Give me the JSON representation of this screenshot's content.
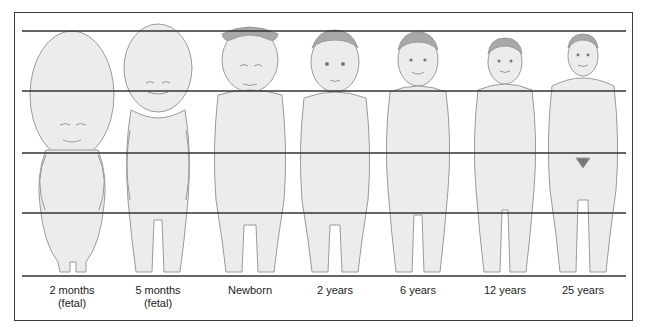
{
  "colors": {
    "frame": "#3a3a3a",
    "guide_line": "#333333",
    "figure_fill": "#ececec",
    "figure_stroke": "#9a9a9a",
    "hair": "#a8a8a8",
    "text": "#222222"
  },
  "guide_lines_y": [
    31,
    91,
    153,
    213,
    276
  ],
  "figures": [
    {
      "id": "2-months-fetal",
      "label_line1": "2 months",
      "label_line2": "(fetal)",
      "center_x": 72
    },
    {
      "id": "5-months-fetal",
      "label_line1": "5 months",
      "label_line2": "(fetal)",
      "center_x": 158
    },
    {
      "id": "newborn",
      "label_line1": "Newborn",
      "label_line2": "",
      "center_x": 250
    },
    {
      "id": "2-years",
      "label_line1": "2 years",
      "label_line2": "",
      "center_x": 335
    },
    {
      "id": "6-years",
      "label_line1": "6 years",
      "label_line2": "",
      "center_x": 418
    },
    {
      "id": "12-years",
      "label_line1": "12 years",
      "label_line2": "",
      "center_x": 505
    },
    {
      "id": "25-years",
      "label_line1": "25 years",
      "label_line2": "",
      "center_x": 583
    }
  ]
}
